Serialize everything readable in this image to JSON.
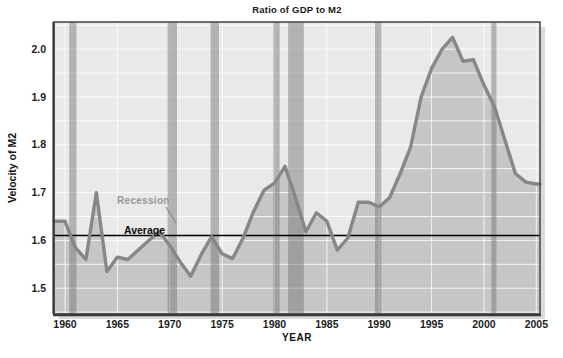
{
  "title": "Ratio of GDP to M2",
  "y_axis": {
    "label": "Velocity of M2",
    "ticks": [
      "2.0",
      "1.9",
      "1.8",
      "1.7",
      "1.6",
      "1.5"
    ],
    "tick_values": [
      2.0,
      1.9,
      1.8,
      1.7,
      1.6,
      1.5
    ],
    "range": [
      1.446,
      2.057
    ],
    "grid_step": 0.05
  },
  "x_axis": {
    "label": "YEAR",
    "ticks": [
      "1960",
      "1965",
      "1970",
      "1975",
      "1980",
      "1985",
      "1990",
      "1995",
      "2000",
      "2005"
    ],
    "tick_values": [
      1960,
      1965,
      1970,
      1975,
      1980,
      1985,
      1990,
      1995,
      2000,
      2005
    ],
    "range": [
      1958.95,
      2005.35
    ],
    "grid_step": 5
  },
  "annotations": {
    "recession_label": "Recession",
    "average_label": "Average",
    "average_value": 1.61
  },
  "chart_data": {
    "type": "area",
    "series_name": "Velocity of M2 (GDP/M2)",
    "x": [
      1959,
      1960,
      1961,
      1962,
      1963,
      1964,
      1965,
      1966,
      1967,
      1968,
      1969,
      1970,
      1971,
      1972,
      1973,
      1974,
      1975,
      1976,
      1977,
      1978,
      1979,
      1980,
      1981,
      1982,
      1983,
      1984,
      1985,
      1986,
      1987,
      1988,
      1989,
      1990,
      1991,
      1992,
      1993,
      1994,
      1995,
      1996,
      1997,
      1998,
      1999,
      2000,
      2001,
      2002,
      2003,
      2004,
      2005
    ],
    "values": [
      1.64,
      1.64,
      1.585,
      1.56,
      1.7,
      1.535,
      1.565,
      1.56,
      1.58,
      1.6,
      1.618,
      1.59,
      1.555,
      1.525,
      1.57,
      1.608,
      1.572,
      1.562,
      1.605,
      1.66,
      1.705,
      1.72,
      1.755,
      1.69,
      1.618,
      1.658,
      1.64,
      1.58,
      1.605,
      1.68,
      1.68,
      1.67,
      1.69,
      1.74,
      1.795,
      1.9,
      1.96,
      2.0,
      2.025,
      1.975,
      1.978,
      1.925,
      1.88,
      1.81,
      1.74,
      1.722,
      1.718
    ],
    "average": 1.61,
    "recessions": [
      [
        1960.4,
        1961.1
      ],
      [
        1969.8,
        1970.7
      ],
      [
        1973.9,
        1974.7
      ],
      [
        1979.9,
        1980.5
      ],
      [
        1981.3,
        1982.8
      ],
      [
        1989.6,
        1990.2
      ],
      [
        2000.7,
        2001.2
      ]
    ],
    "title": "Ratio of GDP to M2",
    "xlabel": "YEAR",
    "ylabel": "Velocity of M2",
    "ylim": [
      1.446,
      2.057
    ],
    "xlim": [
      1958.95,
      2005.35
    ],
    "grid": true,
    "legend": "none",
    "colors": {
      "plot_background": "#e9e9e9",
      "area_fill": "#c6c6c6",
      "gridline": "#ffffff",
      "recession_band": "#6f6f6f",
      "series_line": "#878787",
      "average_line": "#000000",
      "border": "#4d4d4d",
      "recession_text": "#979797"
    }
  }
}
